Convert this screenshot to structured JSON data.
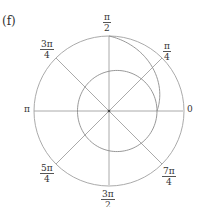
{
  "figure": {
    "panel_label": "(f)",
    "type": "polar_plot",
    "colors": {
      "axis": "#a0a0a0",
      "curve": "#8c8c8c",
      "text": "#333333"
    },
    "angle_labels": [
      {
        "id": "0",
        "num": "0",
        "den": ""
      },
      {
        "id": "pi4",
        "num": "π",
        "den": "4"
      },
      {
        "id": "pi2",
        "num": "π",
        "den": "2"
      },
      {
        "id": "3pi4",
        "num": "3π",
        "den": "4"
      },
      {
        "id": "pi",
        "num": "π",
        "den": ""
      },
      {
        "id": "5pi4",
        "num": "5π",
        "den": "4"
      },
      {
        "id": "3pi2",
        "num": "3π",
        "den": "2"
      },
      {
        "id": "7pi4",
        "num": "7π",
        "den": "4"
      }
    ],
    "curves": [
      {
        "name": "outer-reference-circle",
        "r_relative": 1.0
      },
      {
        "name": "inner-closed-curve",
        "r_at_0": 0.64,
        "r_at_pi": 0.42
      },
      {
        "name": "spiral-segment",
        "theta_start": "0",
        "theta_end": "π/2",
        "r_start": 0.64,
        "r_end": 1.0
      }
    ]
  }
}
